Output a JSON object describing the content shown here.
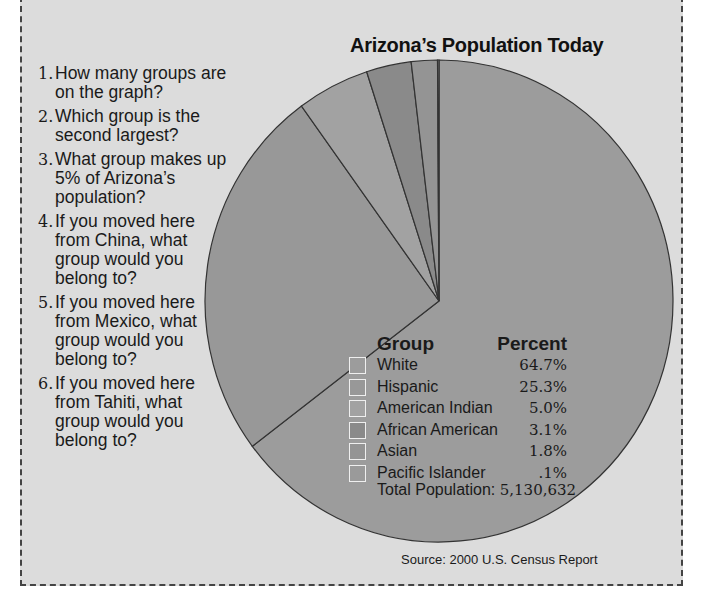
{
  "questions": [
    {
      "num": "1.",
      "text": "How many groups are on the graph?"
    },
    {
      "num": "2.",
      "text": "Which group is the second largest?"
    },
    {
      "num": "3.",
      "text": "What group makes up 5% of Arizona’s population?"
    },
    {
      "num": "4.",
      "text": "If you moved here from China, what group would you belong to?"
    },
    {
      "num": "5.",
      "text": "If you moved here from Mexico, what group would you belong to?"
    },
    {
      "num": "6.",
      "text": "If you moved here from Tahiti, what group would you belong to?"
    }
  ],
  "legend": {
    "group_header": "Group",
    "percent_header": "Percent",
    "total_label": "Total Population:",
    "total_value": "5,130,632"
  },
  "source": "Source: 2000 U.S. Census Report",
  "colors": {
    "background": "#dcdcdc",
    "slice_outline": "#333333"
  },
  "chart_data": {
    "type": "pie",
    "title": "Arizona’s Population Today",
    "categories": [
      "White",
      "Hispanic",
      "American Indian",
      "African American",
      "Asian",
      "Pacific Islander"
    ],
    "values": [
      64.7,
      25.3,
      5.0,
      3.1,
      1.8,
      0.1
    ],
    "value_labels": [
      "64.7%",
      "25.3%",
      "5.0%",
      "3.1%",
      "1.8%",
      ".1%"
    ],
    "slice_colors": [
      "#9c9c9c",
      "#989898",
      "#a2a2a2",
      "#8a8a8a",
      "#949494",
      "#9a9a9a"
    ],
    "start_angle_deg": 0,
    "direction": "clockwise",
    "legend_position": "inside-pie lower-right",
    "total_population": 5130632,
    "source": "2000 U.S. Census Report"
  }
}
